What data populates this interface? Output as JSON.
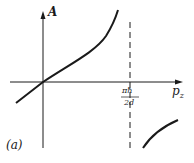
{
  "figure": {
    "y_axis_label": "A",
    "x_axis_label": "p",
    "x_axis_subscript": "z",
    "asymptote_numerator": "πħ",
    "asymptote_denominator": "2d",
    "panel_label": "(a)"
  },
  "colors": {
    "ink": "#1a1a1a",
    "background": "#ffffff"
  }
}
